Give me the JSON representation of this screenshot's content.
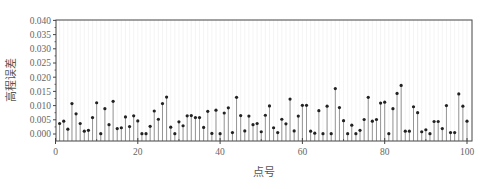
{
  "chart_data": {
    "type": "stem",
    "title": "",
    "xlabel": "点号",
    "ylabel": "高程误差",
    "xlim": [
      0,
      101
    ],
    "ylim": [
      -0.0025,
      0.04
    ],
    "xticks": [
      0,
      20,
      40,
      60,
      80,
      100
    ],
    "xtick_labels": [
      "0",
      "20",
      "40",
      "60",
      "80",
      "100"
    ],
    "yticks": [
      0.0,
      0.005,
      0.01,
      0.015,
      0.02,
      0.025,
      0.03,
      0.035,
      0.04
    ],
    "ytick_labels": [
      "0.000",
      "0.005",
      "0.010",
      "0.015",
      "0.020",
      "0.025",
      "0.030",
      "0.035",
      "0.040"
    ],
    "grid": "faint vertical lines at each point",
    "legend": null,
    "x": [
      1,
      2,
      3,
      4,
      5,
      6,
      7,
      8,
      9,
      10,
      11,
      12,
      13,
      14,
      15,
      16,
      17,
      18,
      19,
      20,
      21,
      22,
      23,
      24,
      25,
      26,
      27,
      28,
      29,
      30,
      31,
      32,
      33,
      34,
      35,
      36,
      37,
      38,
      39,
      40,
      41,
      42,
      43,
      44,
      45,
      46,
      47,
      48,
      49,
      50,
      51,
      52,
      53,
      54,
      55,
      56,
      57,
      58,
      59,
      60,
      61,
      62,
      63,
      64,
      65,
      66,
      67,
      68,
      69,
      70,
      71,
      72,
      73,
      74,
      75,
      76,
      77,
      78,
      79,
      80,
      81,
      82,
      83,
      84,
      85,
      86,
      87,
      88,
      89,
      90,
      91,
      92,
      93,
      94,
      95,
      96,
      97,
      98,
      99,
      100
    ],
    "values": [
      0.0037,
      0.0045,
      0.0017,
      0.0107,
      0.0071,
      0.0037,
      0.001,
      0.0013,
      0.0058,
      0.011,
      0.0001,
      0.0089,
      0.0033,
      0.0115,
      0.0019,
      0.0022,
      0.006,
      0.0026,
      0.0064,
      0.0046,
      0.0001,
      0.0001,
      0.0027,
      0.0081,
      0.0052,
      0.0107,
      0.013,
      0.0024,
      0.0001,
      0.0043,
      0.0029,
      0.0064,
      0.0065,
      0.0058,
      0.0058,
      0.0023,
      0.008,
      0.0002,
      0.0084,
      0.0001,
      0.0074,
      0.0092,
      0.0005,
      0.0129,
      0.0065,
      0.0011,
      0.0063,
      0.0033,
      0.0037,
      0.0008,
      0.0066,
      0.0099,
      0.0022,
      0.0005,
      0.0052,
      0.0036,
      0.0123,
      0.0011,
      0.0063,
      0.0101,
      0.0101,
      0.001,
      0.0003,
      0.0082,
      0.0001,
      0.0098,
      0.0001,
      0.016,
      0.0093,
      0.0047,
      0.0001,
      0.0031,
      0.0001,
      0.0013,
      0.0051,
      0.0129,
      0.0045,
      0.0051,
      0.0109,
      0.0112,
      0.0001,
      0.0089,
      0.0143,
      0.0171,
      0.001,
      0.001,
      0.0096,
      0.0075,
      0.0008,
      0.0015,
      0.0001,
      0.0044,
      0.0044,
      0.0019,
      0.01,
      0.0005,
      0.0005,
      0.0141,
      0.0098,
      0.0045
    ],
    "marker": "filled dot",
    "stem_color": "#8a8a8a",
    "marker_color": "#222222",
    "axis_color": "#444444"
  }
}
